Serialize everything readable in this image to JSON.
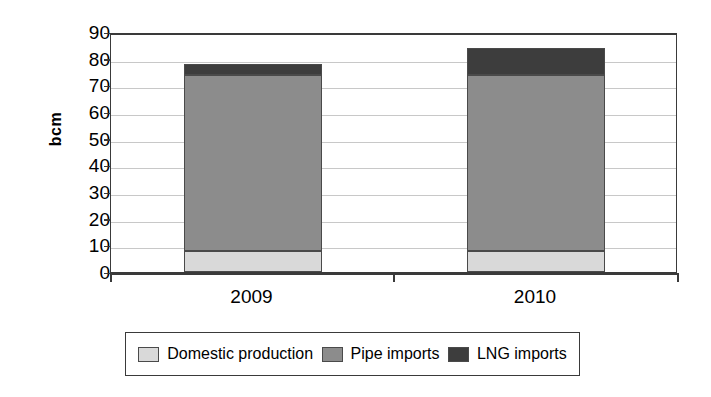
{
  "chart_data": {
    "type": "bar",
    "subtype": "stacked-column",
    "title": "",
    "xlabel": "",
    "ylabel": "bcm",
    "categories": [
      "2009",
      "2010"
    ],
    "series": [
      {
        "name": "Domestic production",
        "values": [
          8,
          8
        ],
        "color": "#d9d9d9"
      },
      {
        "name": "Pipe imports",
        "values": [
          66,
          66
        ],
        "color": "#8c8c8c"
      },
      {
        "name": "LNG imports",
        "values": [
          4,
          10
        ],
        "color": "#3d3d3d"
      }
    ],
    "totals": [
      78,
      84
    ],
    "ylim": [
      0,
      90
    ],
    "ytick_step": 10,
    "yticks": [
      90,
      80,
      70,
      60,
      50,
      40,
      30,
      20,
      10,
      0
    ],
    "ytick_labels": [
      "90",
      "80",
      "70",
      "60",
      "50",
      "40",
      "30",
      "20",
      "10",
      "0"
    ],
    "grid": true,
    "grid_axis": "y",
    "legend_position": "bottom"
  },
  "legend": {
    "items": [
      {
        "label": "Domestic production",
        "color": "#d9d9d9"
      },
      {
        "label": "Pipe imports",
        "color": "#8c8c8c"
      },
      {
        "label": "LNG imports",
        "color": "#3d3d3d"
      }
    ]
  }
}
